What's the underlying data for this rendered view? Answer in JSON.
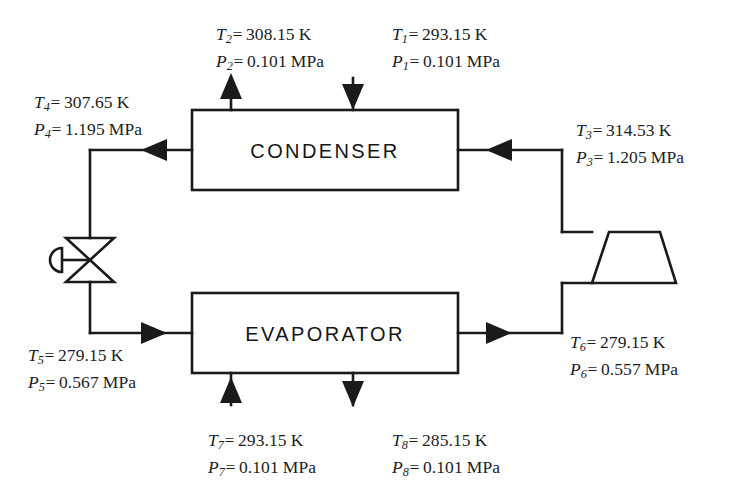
{
  "diagram": {
    "components": {
      "condenser_label": "CONDENSER",
      "evaporator_label": "EVAPORATOR",
      "expansion_valve_name": "expansion-valve",
      "compressor_name": "compressor"
    },
    "colors": {
      "line": "#1a1a1a",
      "text": "#1d1d1d",
      "background": "#ffffff"
    }
  },
  "states": {
    "s1": {
      "t_symbol": "T",
      "t_sub": "1",
      "t_value": "293.15",
      "t_unit": "K",
      "p_symbol": "P",
      "p_sub": "1",
      "p_value": "0.101",
      "p_unit": "MPa",
      "stream": "condenser air inlet",
      "arrow": "down"
    },
    "s2": {
      "t_symbol": "T",
      "t_sub": "2",
      "t_value": "308.15",
      "t_unit": "K",
      "p_symbol": "P",
      "p_sub": "2",
      "p_value": "0.101",
      "p_unit": "MPa",
      "stream": "condenser air outlet",
      "arrow": "up"
    },
    "s3": {
      "t_symbol": "T",
      "t_sub": "3",
      "t_value": "314.53",
      "t_unit": "K",
      "p_symbol": "P",
      "p_sub": "3",
      "p_value": "1.205",
      "p_unit": "MPa",
      "stream": "compressor discharge to condenser",
      "arrow": "left"
    },
    "s4": {
      "t_symbol": "T",
      "t_sub": "4",
      "t_value": "307.65",
      "t_unit": "K",
      "p_symbol": "P",
      "p_sub": "4",
      "p_value": "1.195",
      "p_unit": "MPa",
      "stream": "condenser outlet to expansion valve",
      "arrow": "left"
    },
    "s5": {
      "t_symbol": "T",
      "t_sub": "5",
      "t_value": "279.15",
      "t_unit": "K",
      "p_symbol": "P",
      "p_sub": "5",
      "p_value": "0.567",
      "p_unit": "MPa",
      "stream": "expansion valve outlet to evaporator",
      "arrow": "right"
    },
    "s6": {
      "t_symbol": "T",
      "t_sub": "6",
      "t_value": "279.15",
      "t_unit": "K",
      "p_symbol": "P",
      "p_sub": "6",
      "p_value": "0.557",
      "p_unit": "MPa",
      "stream": "evaporator outlet to compressor",
      "arrow": "right"
    },
    "s7": {
      "t_symbol": "T",
      "t_sub": "7",
      "t_value": "293.15",
      "t_unit": "K",
      "p_symbol": "P",
      "p_sub": "7",
      "p_value": "0.101",
      "p_unit": "MPa",
      "stream": "evaporator air inlet",
      "arrow": "up"
    },
    "s8": {
      "t_symbol": "T",
      "t_sub": "8",
      "t_value": "285.15",
      "t_unit": "K",
      "p_symbol": "P",
      "p_sub": "8",
      "p_value": "0.101",
      "p_unit": "MPa",
      "stream": "evaporator air outlet",
      "arrow": "down"
    }
  }
}
